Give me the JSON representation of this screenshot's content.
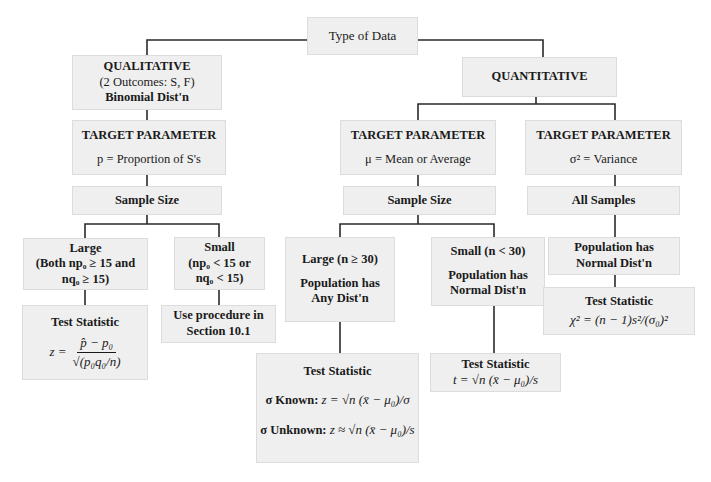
{
  "root": {
    "label": "Type of Data"
  },
  "qualitative": {
    "title": "QUALITATIVE",
    "subtitle": "(2 Outcomes: S, F)",
    "dist": "Binomial Dist'n",
    "target": {
      "heading": "TARGET PARAMETER",
      "param": "p = Proportion of S's"
    },
    "sample_size": "Sample Size",
    "large": {
      "line1": "Large",
      "line2": "(Both np₀ ≥ 15 and",
      "line3": "nq₀ ≥ 15)"
    },
    "small": {
      "line1": "Small",
      "line2": "(np₀ < 15 or",
      "line3": "nq₀ < 15)"
    },
    "test_statistic": {
      "heading": "Test Statistic",
      "lhs": "z =",
      "numerator": "p̂ − p₀",
      "denominator": "√(p₀q₀/n)"
    },
    "procedure": {
      "line1": "Use procedure in",
      "line2": "Section 10.1"
    }
  },
  "quantitative": {
    "title": "QUANTITATIVE",
    "mean_branch": {
      "target": {
        "heading": "TARGET PARAMETER",
        "param": "μ = Mean or Average"
      },
      "sample_size": "Sample Size",
      "large": {
        "line1": "Large (n ≥ 30)",
        "line2": "Population has",
        "line3": "Any Dist'n"
      },
      "small": {
        "line1": "Small (n < 30)",
        "line2": "Population has",
        "line3": "Normal Dist'n"
      },
      "large_test": {
        "heading": "Test Statistic",
        "known_label": "σ Known:",
        "known_formula": "z = √n (x̄ − μ₀)/σ",
        "unknown_label": "σ Unknown:",
        "unknown_formula": "z ≈ √n (x̄ − μ₀)/s"
      },
      "small_test": {
        "heading": "Test Statistic",
        "formula": "t = √n (x̄ − μ₀)/s"
      }
    },
    "variance_branch": {
      "target": {
        "heading": "TARGET PARAMETER",
        "param": "σ² = Variance"
      },
      "samples": "All Samples",
      "population": {
        "line1": "Population has",
        "line2": "Normal Dist'n"
      },
      "test": {
        "heading": "Test Statistic",
        "formula": "χ² = (n − 1)s²/(σ₀)²"
      }
    }
  }
}
